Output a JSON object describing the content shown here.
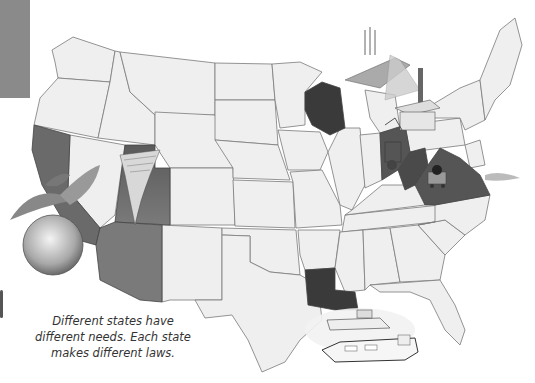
{
  "illustration": {
    "subject": "Map of the United States with selected states highlighted",
    "colors": {
      "state_fill": "#eeeeee",
      "border": "#7a7a7a",
      "highlight_dark": "#3a3a3a",
      "highlight_mid": "#6e6e6e",
      "tab": "#8a8a8a"
    },
    "highlighted_states": [
      "California",
      "Utah",
      "Arizona",
      "Wisconsin",
      "Ohio",
      "West Virginia",
      "Virginia",
      "Louisiana"
    ],
    "pictures": [
      {
        "name": "peach",
        "near": "California"
      },
      {
        "name": "canyon-waterfall",
        "near": "Utah/Arizona"
      },
      {
        "name": "fishing-boat",
        "near": "Wisconsin"
      },
      {
        "name": "factory",
        "near": "Ohio"
      },
      {
        "name": "coal-cart",
        "near": "West Virginia"
      },
      {
        "name": "ships",
        "near": "Louisiana"
      }
    ]
  },
  "caption": {
    "line1": "Different states have",
    "line2": "different needs.  Each state",
    "line3": "makes different laws."
  }
}
